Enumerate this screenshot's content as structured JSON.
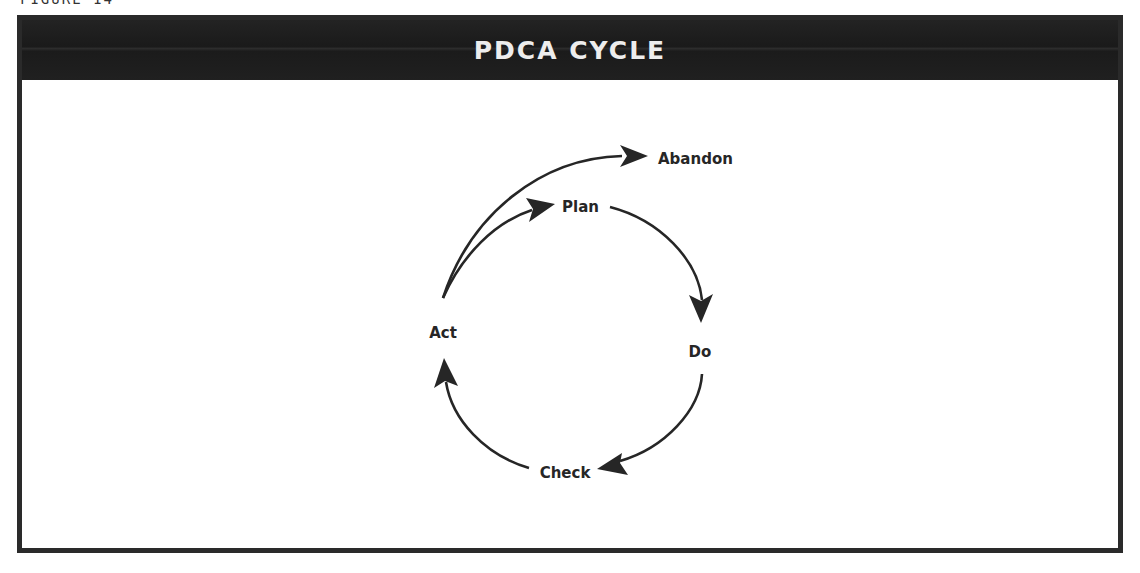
{
  "figure": {
    "label": "FIGURE 14"
  },
  "title": "PDCA CYCLE",
  "colors": {
    "title_bar": "#1f1f1f",
    "title_text": "#ededed",
    "frame_border": "#2a2a2a",
    "arrow": "#262626",
    "label_text": "#262626",
    "background": "#ffffff"
  },
  "nodes": {
    "plan": {
      "label": "Plan"
    },
    "do": {
      "label": "Do"
    },
    "check": {
      "label": "Check"
    },
    "act": {
      "label": "Act"
    },
    "abandon": {
      "label": "Abandon"
    }
  },
  "edges": [
    {
      "from": "Act",
      "to": "Plan"
    },
    {
      "from": "Plan",
      "to": "Do"
    },
    {
      "from": "Do",
      "to": "Check"
    },
    {
      "from": "Check",
      "to": "Act"
    },
    {
      "from": "Act",
      "to": "Abandon"
    }
  ]
}
